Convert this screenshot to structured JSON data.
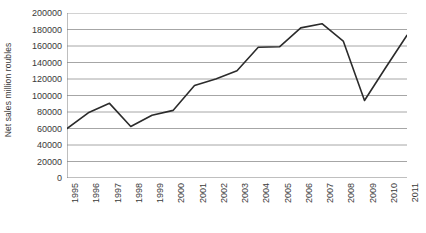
{
  "chart_data": {
    "type": "line",
    "title": "",
    "xlabel": "",
    "ylabel": "Net sales million roubles",
    "categories": [
      "1995",
      "1996",
      "1997",
      "1998",
      "1999",
      "2000",
      "2001",
      "2002",
      "2003",
      "2004",
      "2005",
      "2006",
      "2007",
      "2008",
      "2009",
      "2010",
      "2011"
    ],
    "values": [
      60000,
      79000,
      90500,
      62500,
      76000,
      82000,
      112000,
      120000,
      130000,
      158500,
      159000,
      182000,
      187000,
      166000,
      94000,
      134000,
      173000
    ],
    "series": [
      {
        "name": "Net sales",
        "values": [
          60000,
          79000,
          90500,
          62500,
          76000,
          82000,
          112000,
          120000,
          130000,
          158500,
          159000,
          182000,
          187000,
          166000,
          94000,
          134000,
          173000
        ]
      }
    ],
    "ylim": [
      0,
      200000
    ],
    "ytick_step": 20000,
    "ytick_labels": [
      "0",
      "20000",
      "40000",
      "60000",
      "80000",
      "100000",
      "120000",
      "140000",
      "160000",
      "180000",
      "200000"
    ],
    "ytick_values": [
      0,
      20000,
      40000,
      60000,
      80000,
      100000,
      120000,
      140000,
      160000,
      180000,
      200000
    ],
    "grid": "horizontal",
    "legend": "none",
    "line_color": "#2b2b2b",
    "grid_color": "#a6a6a6",
    "axis_color": "#7f7f7f",
    "background_color": "#ffffff"
  }
}
